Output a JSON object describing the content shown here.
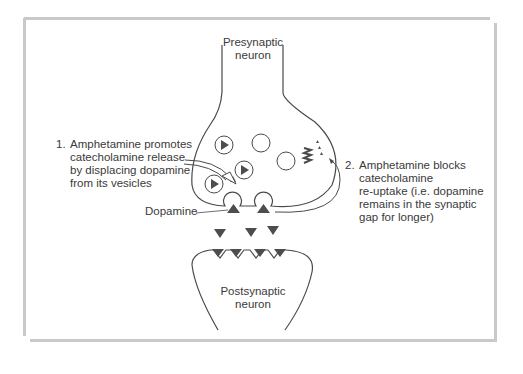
{
  "diagram": {
    "presynaptic_label": [
      "Presynaptic",
      "neuron"
    ],
    "postsynaptic_label": [
      "Postsynaptic",
      "neuron"
    ],
    "dopamine_label": "Dopamine",
    "annotation_1": {
      "number": "1.",
      "lines": [
        "Amphetamine promotes",
        "catecholamine release",
        "by displacing dopamine",
        "from its vesicles"
      ]
    },
    "annotation_2": {
      "number": "2.",
      "lines": [
        "Amphetamine blocks",
        "catecholamine",
        "re-uptake (i.e. dopamine",
        "remains in the synaptic",
        "gap for longer)"
      ]
    },
    "colors": {
      "line": "#4a4a4a",
      "triangle": "#4d4d4d",
      "frame": "#c9c9c9"
    }
  }
}
